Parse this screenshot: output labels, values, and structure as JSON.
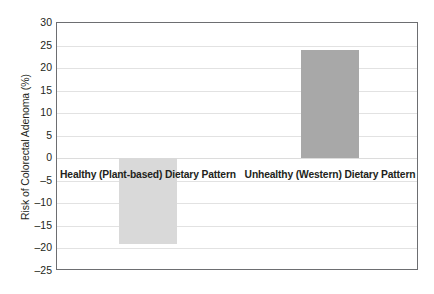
{
  "chart_data": {
    "type": "bar",
    "title": "",
    "xlabel": "",
    "ylabel": "Risk of Colorectal Adenoma (%)",
    "categories": [
      "Healthy (Plant-based) Dietary Pattern",
      "Unhealthy (Western) Dietary Pattern"
    ],
    "values": [
      -19,
      24
    ],
    "ylim": [
      -25,
      30
    ],
    "yticks": [
      30,
      25,
      20,
      15,
      10,
      5,
      0,
      -5,
      -10,
      -15,
      -20,
      -25
    ],
    "ytick_labels": [
      "30",
      "25",
      "20",
      "15",
      "10",
      "5",
      "0",
      "–5",
      "–10",
      "–15",
      "–20",
      "–25"
    ],
    "grid": true,
    "legend": "none",
    "bar_colors": [
      "#d9d9d9",
      "#a8a8a8"
    ],
    "bars": [
      {
        "label": "Healthy (Plant-based) Dietary Pattern",
        "value": -19,
        "color": "#d9d9d9"
      },
      {
        "label": "Unhealthy (Western) Dietary Pattern",
        "value": 24,
        "color": "#a8a8a8"
      }
    ]
  },
  "colors": {
    "axis_border": "#6d6e71",
    "gridline": "#e2e2e2",
    "text": "#231f20",
    "background": "#ffffff"
  }
}
